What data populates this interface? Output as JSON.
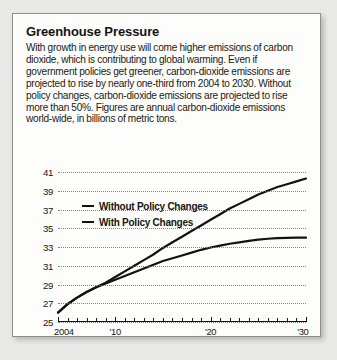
{
  "card": {
    "title": "Greenhouse Pressure",
    "body": "With growth in energy use will come higher emissions of carbon dioxide, which is contributing to global warming. Even if government policies get greener, carbon-dioxide emissions are projected to rise by nearly one-third from 2004 to 2030. Without policy changes, carbon-dioxide emissions are projected to rise more than 50%. Figures are annual carbon-dioxide emissions world-wide, in billions of metric tons."
  },
  "colors": {
    "line": "#121210",
    "grid": "#6e6e6a",
    "card_bg": "#fdfdfb",
    "page_bg": "#e9e9e7",
    "border": "#8d8d8a",
    "text": "#17150f"
  },
  "chart_data": {
    "type": "line",
    "title": "Greenhouse Pressure",
    "subtitle": "Annual carbon-dioxide emissions world-wide, in billions of metric tons",
    "xlabel": "",
    "ylabel": "",
    "xlim": [
      2004,
      2030
    ],
    "ylim": [
      25,
      41
    ],
    "grid": true,
    "legend_position": "inside-top-left",
    "y_ticks": [
      41,
      39,
      37,
      35,
      33,
      31,
      29,
      27,
      25
    ],
    "x_tick_values": [
      2004,
      2005,
      2006,
      2007,
      2008,
      2009,
      2010,
      2011,
      2012,
      2013,
      2014,
      2015,
      2016,
      2017,
      2018,
      2019,
      2020,
      2021,
      2022,
      2023,
      2024,
      2025,
      2026,
      2027,
      2028,
      2029,
      2030
    ],
    "x_tick_labels": [
      {
        "value": 2004,
        "label": "2004"
      },
      {
        "value": 2010,
        "label": "'10"
      },
      {
        "value": 2020,
        "label": "'20"
      },
      {
        "value": 2030,
        "label": "'30"
      }
    ],
    "x": [
      2004,
      2005,
      2006,
      2007,
      2008,
      2009,
      2010,
      2011,
      2012,
      2013,
      2014,
      2015,
      2016,
      2017,
      2018,
      2019,
      2020,
      2021,
      2022,
      2023,
      2024,
      2025,
      2026,
      2027,
      2028,
      2029,
      2030
    ],
    "series": [
      {
        "name": "Without Policy Changes",
        "values": [
          26.0,
          26.9,
          27.6,
          28.2,
          28.7,
          29.2,
          29.8,
          30.4,
          31.0,
          31.6,
          32.2,
          32.9,
          33.5,
          34.1,
          34.7,
          35.3,
          35.9,
          36.5,
          37.1,
          37.6,
          38.1,
          38.6,
          39.0,
          39.4,
          39.7,
          40.0,
          40.3
        ]
      },
      {
        "name": "With Policy Changes",
        "values": [
          26.0,
          26.9,
          27.6,
          28.2,
          28.7,
          29.1,
          29.5,
          29.9,
          30.3,
          30.7,
          31.1,
          31.5,
          31.8,
          32.1,
          32.4,
          32.7,
          32.95,
          33.15,
          33.35,
          33.5,
          33.65,
          33.78,
          33.88,
          33.94,
          33.98,
          34.0,
          34.0
        ]
      }
    ]
  }
}
